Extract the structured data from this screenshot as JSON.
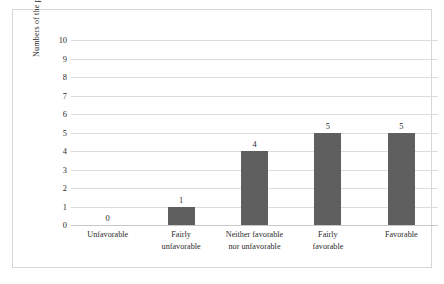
{
  "chart_data": {
    "type": "bar",
    "title": "",
    "xlabel": "",
    "ylabel": "Numbers of the participants",
    "categories": [
      "Unfavorable",
      "Fairly unfavorable",
      "Neither favorable nor unfavorable",
      "Fairly favorable",
      "Favorable"
    ],
    "category_lines": [
      [
        "Unfavorable"
      ],
      [
        "Fairly",
        "unfavorable"
      ],
      [
        "Neither favorable",
        "nor unfavorable"
      ],
      [
        "Fairly",
        "favorable"
      ],
      [
        "Favorable"
      ]
    ],
    "values": [
      0,
      1,
      4,
      5,
      5
    ],
    "value_labels": [
      "0",
      "1",
      "4",
      "5",
      "5"
    ],
    "ylim": [
      0,
      10
    ],
    "ytick_labels": [
      "10",
      "9",
      "8",
      "7",
      "6",
      "5",
      "4",
      "3",
      "2",
      "1",
      "0"
    ],
    "ytick_values": [
      10,
      9,
      8,
      7,
      6,
      5,
      4,
      3,
      2,
      1,
      0
    ],
    "grid": true,
    "legend": false,
    "bar_color": "#5f5f5f",
    "gridline_color": "#dcdcdc",
    "frame_color": "#d6d6d6",
    "background_color": "#ffffff"
  }
}
